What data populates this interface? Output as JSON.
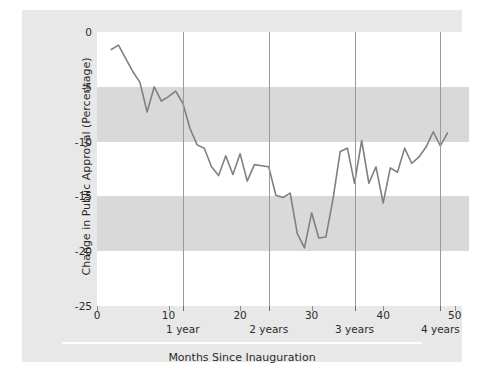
{
  "chart_data": {
    "type": "line",
    "title": "",
    "xlabel": "Months Since Inauguration",
    "ylabel": "Change in Public Approval (Percentage)",
    "xlim": [
      0,
      52
    ],
    "ylim": [
      -25,
      0
    ],
    "grid": false,
    "legend": null,
    "line_color": "#808080",
    "xticks": [
      0,
      10,
      20,
      30,
      40,
      50
    ],
    "xtick_labels": [
      "0",
      "10",
      "20",
      "30",
      "40",
      "50"
    ],
    "yticks": [
      0,
      -5,
      -10,
      -15,
      -20,
      -25
    ],
    "ytick_labels": [
      "0",
      "-5",
      "-10",
      "-15",
      "-20",
      "-25"
    ],
    "annotations": [
      {
        "label": "1 year",
        "x": 12
      },
      {
        "label": "2 years",
        "x": 24
      },
      {
        "label": "3 years",
        "x": 36
      },
      {
        "label": "4 years",
        "x": 48
      }
    ],
    "band_color": "#d9d9d9",
    "bands": [
      {
        "from": -5,
        "to": -10
      },
      {
        "from": -15,
        "to": -20
      }
    ],
    "x": [
      2,
      3,
      4,
      5,
      6,
      7,
      8,
      9,
      10,
      11,
      12,
      13,
      14,
      15,
      16,
      17,
      18,
      19,
      20,
      21,
      22,
      23,
      24,
      25,
      26,
      27,
      28,
      29,
      30,
      31,
      32,
      33,
      34,
      35,
      36,
      37,
      38,
      39,
      40,
      41,
      42,
      43,
      44,
      45,
      46,
      47,
      48,
      49
    ],
    "values": [
      -1.6,
      -1.2,
      -2.4,
      -3.6,
      -4.6,
      -7.3,
      -5.0,
      -6.3,
      -5.9,
      -5.4,
      -6.5,
      -8.8,
      -10.3,
      -10.6,
      -12.3,
      -13.1,
      -11.3,
      -13.0,
      -11.1,
      -13.6,
      -12.1,
      -12.2,
      -12.3,
      -14.9,
      -15.1,
      -14.7,
      -18.4,
      -19.7,
      -16.5,
      -18.8,
      -18.7,
      -15.2,
      -10.9,
      -10.6,
      -13.8,
      -9.9,
      -13.8,
      -12.3,
      -15.6,
      -12.4,
      -12.8,
      -10.6,
      -12.0,
      -11.4,
      -10.5,
      -9.1,
      -10.4,
      -9.2
    ]
  }
}
